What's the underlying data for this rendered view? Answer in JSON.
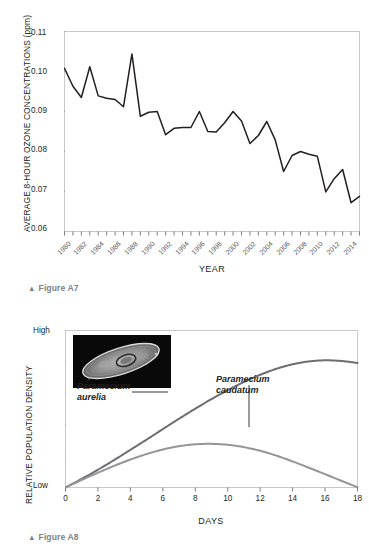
{
  "page": {
    "figures": [
      {
        "id": "A7",
        "caption": "Figure A7",
        "triangle": "▲"
      },
      {
        "id": "A8",
        "caption": "Figure A8",
        "triangle": "▲"
      }
    ]
  },
  "chart_data": [
    {
      "type": "line",
      "figure": "A7",
      "title": "",
      "xlabel": "YEAR",
      "ylabel": "AVERAGE 8-HOUR OZONE CONCENTRATIONS (ppm)",
      "xlim": [
        1980,
        2015
      ],
      "ylim": [
        0.06,
        0.11
      ],
      "ytick_labels": [
        "0.11",
        "0.10",
        "0.09",
        "0.08",
        "0.07",
        "0.06"
      ],
      "ytick_values": [
        0.11,
        0.1,
        0.09,
        0.08,
        0.07,
        0.06
      ],
      "xtick_labels": [
        "1980",
        "1982",
        "1984",
        "1986",
        "1988",
        "1990",
        "1992",
        "1994",
        "1996",
        "1998",
        "2000",
        "2002",
        "2004",
        "2006",
        "2008",
        "2010",
        "2012",
        "2014"
      ],
      "xtick_values": [
        1980,
        1982,
        1984,
        1986,
        1988,
        1990,
        1992,
        1994,
        1996,
        1998,
        2000,
        2002,
        2004,
        2006,
        2008,
        2010,
        2012,
        2014
      ],
      "minor_ticks_every": 1,
      "grid": false,
      "legend": "none",
      "line_color": "#231f20",
      "x": [
        1980,
        1981,
        1982,
        1983,
        1984,
        1985,
        1986,
        1987,
        1988,
        1989,
        1990,
        1991,
        1992,
        1993,
        1994,
        1995,
        1996,
        1997,
        1998,
        1999,
        2000,
        2001,
        2002,
        2003,
        2004,
        2005,
        2006,
        2007,
        2008,
        2009,
        2010,
        2011,
        2012,
        2013,
        2014,
        2015
      ],
      "values": [
        0.1008,
        0.0963,
        0.0935,
        0.1012,
        0.0939,
        0.0933,
        0.093,
        0.0912,
        0.1044,
        0.0888,
        0.0898,
        0.09,
        0.0842,
        0.0858,
        0.086,
        0.086,
        0.09,
        0.085,
        0.0849,
        0.0872,
        0.09,
        0.0876,
        0.082,
        0.084,
        0.0875,
        0.0829,
        0.075,
        0.079,
        0.08,
        0.0793,
        0.0788,
        0.0699,
        0.0732,
        0.0755,
        0.0672,
        0.0688
      ]
    },
    {
      "type": "line",
      "figure": "A8",
      "title": "",
      "xlabel": "DAYS",
      "ylabel": "RELATIVE POPULATION DENSITY",
      "xlim": [
        0,
        18
      ],
      "ylim": [
        0,
        1
      ],
      "ytick_labels": [
        "High",
        "Low"
      ],
      "ytick_positions": [
        1,
        0
      ],
      "xtick_labels": [
        "0",
        "2",
        "4",
        "6",
        "8",
        "10",
        "12",
        "14",
        "16",
        "18"
      ],
      "xtick_values": [
        0,
        2,
        4,
        6,
        8,
        10,
        12,
        14,
        16,
        18
      ],
      "grid": false,
      "legend": "inline-labels",
      "series": [
        {
          "name": "Paramecium aurelia",
          "label_text": "Paramecium\naurelia",
          "color": "#6d6e71",
          "x": [
            0,
            1,
            2,
            3,
            4,
            5,
            6,
            7,
            8,
            9,
            10,
            11,
            12,
            13,
            14,
            15,
            16,
            17,
            18
          ],
          "values": [
            0.0,
            0.055,
            0.113,
            0.175,
            0.24,
            0.305,
            0.372,
            0.438,
            0.502,
            0.563,
            0.62,
            0.672,
            0.718,
            0.756,
            0.785,
            0.803,
            0.81,
            0.806,
            0.793
          ]
        },
        {
          "name": "Paramecium caudatum",
          "label_text": "Paramecium\ncaudatum",
          "color": "#939598",
          "x": [
            0,
            1,
            2,
            3,
            4,
            5,
            6,
            7,
            8,
            9,
            10,
            11,
            12,
            13,
            14,
            15,
            16,
            17,
            18
          ],
          "values": [
            0.0,
            0.048,
            0.094,
            0.138,
            0.178,
            0.213,
            0.242,
            0.263,
            0.275,
            0.278,
            0.272,
            0.257,
            0.234,
            0.203,
            0.166,
            0.126,
            0.085,
            0.043,
            0.002
          ]
        }
      ],
      "inset_image": "paramecium-micrograph"
    }
  ]
}
